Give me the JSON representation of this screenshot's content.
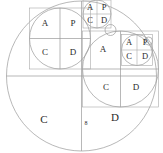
{
  "diagram": {
    "stroke_color": "#9a9a9a",
    "text_color": "#2b2b2b",
    "background": "#ffffff",
    "caption": "8",
    "level1": {
      "name": "main-circle",
      "cells": {
        "bottom_left": "C",
        "bottom_right": "D"
      }
    },
    "level2_left": {
      "name": "top-left-circle",
      "cells": {
        "top_left": "A",
        "top_right": "P",
        "bottom_left": "C",
        "bottom_right": "D"
      }
    },
    "level2_right": {
      "name": "mid-right-circle",
      "cells": {
        "top_left": "A",
        "bottom_left": "C",
        "bottom_right": "D"
      }
    },
    "level3_top": {
      "name": "small-top-circle",
      "cells": {
        "top_left": "A",
        "top_right": "P",
        "bottom_left": "C",
        "bottom_right": "D"
      }
    },
    "level3_right": {
      "name": "small-right-circle",
      "cells": {
        "top_left": "A",
        "top_right": "P",
        "bottom_left": "C",
        "bottom_right": "D"
      }
    }
  }
}
